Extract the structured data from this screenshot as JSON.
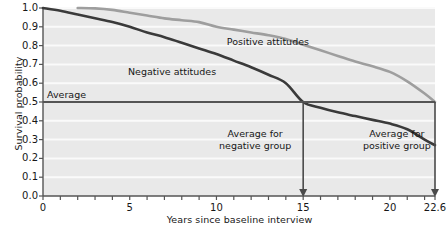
{
  "chart_data": {
    "type": "line",
    "title": "",
    "xlabel": "Years since baseline interview",
    "ylabel": "Survival probability",
    "xlim": [
      0,
      22.6
    ],
    "ylim": [
      0,
      1.0
    ],
    "grid": true,
    "legend_position": "inline-labels",
    "x_ticks_major": [
      "0",
      "5",
      "10",
      "15",
      "20",
      "22.6"
    ],
    "x_ticks_major_values": [
      0,
      5,
      10,
      15,
      20,
      22.6
    ],
    "x_tick_interval_minor": 1,
    "y_ticks": [
      "0.0",
      "0.1",
      "0.2",
      "0.3",
      "0.4",
      "0.5",
      "0.6",
      "0.7",
      "0.8",
      "0.9",
      "1.0"
    ],
    "y_tick_values": [
      0.0,
      0.1,
      0.2,
      0.3,
      0.4,
      0.5,
      0.6,
      0.7,
      0.8,
      0.9,
      1.0
    ],
    "series": [
      {
        "name": "Negative attitudes",
        "color": "#3a3a3a",
        "label_x": 4.9,
        "label_y": 0.66,
        "x": [
          0,
          1,
          2,
          3,
          4,
          5,
          6,
          7,
          8,
          9,
          10,
          11,
          12,
          13,
          14,
          15,
          16,
          17,
          18,
          19,
          20,
          21,
          22,
          22.6
        ],
        "values": [
          1.0,
          0.985,
          0.965,
          0.945,
          0.925,
          0.9,
          0.87,
          0.845,
          0.815,
          0.785,
          0.755,
          0.72,
          0.685,
          0.645,
          0.6,
          0.5,
          0.47,
          0.445,
          0.425,
          0.405,
          0.385,
          0.355,
          0.3,
          0.27
        ]
      },
      {
        "name": "Positive attitudes",
        "color": "#9e9e9e",
        "label_x": 10.6,
        "label_y": 0.82,
        "x": [
          2,
          3,
          4,
          5,
          6,
          7,
          8,
          9,
          10,
          11,
          12,
          13,
          14,
          15,
          16,
          17,
          18,
          19,
          20,
          21,
          22,
          22.6
        ],
        "values": [
          1.0,
          0.998,
          0.99,
          0.975,
          0.96,
          0.945,
          0.935,
          0.925,
          0.9,
          0.885,
          0.87,
          0.855,
          0.835,
          0.805,
          0.775,
          0.745,
          0.715,
          0.69,
          0.66,
          0.61,
          0.545,
          0.5
        ]
      }
    ],
    "reference_line": {
      "name": "Average",
      "label": "Average",
      "y_value": 0.5,
      "color": "#555555"
    },
    "annotations": [
      {
        "name": "average-for-negative-group",
        "line1": "Average for",
        "line2": "negative group",
        "x": 15,
        "label_y": 0.33,
        "arrow_from_y": 0.5,
        "arrow_to_y": 0.0
      },
      {
        "name": "average-for-positive-group",
        "line1": "Average for",
        "line2": "positive group",
        "x": 20.4,
        "label_y": 0.33,
        "arrow_x": 22.6,
        "arrow_from_y": 0.5,
        "arrow_to_y": 0.0
      }
    ],
    "colors": {
      "plot_background": "#e9e9e9",
      "gridline": "#fafafa",
      "axis": "#555555",
      "negative_series": "#3a3a3a",
      "positive_series": "#9e9e9e",
      "text": "#171717"
    }
  }
}
